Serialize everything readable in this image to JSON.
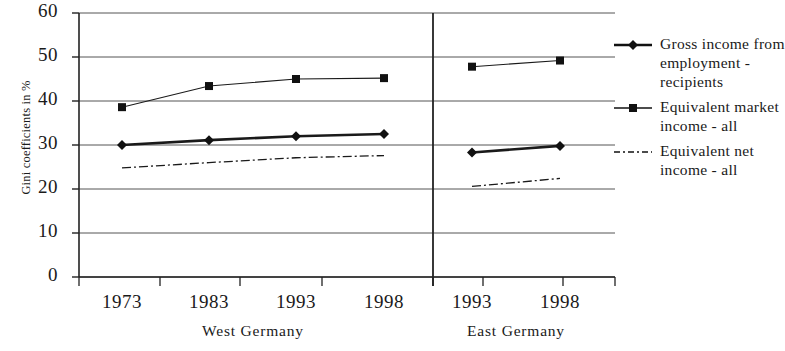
{
  "chart_data": {
    "type": "line",
    "title": "",
    "xlabel": "",
    "ylabel": "Gini coefficients in %",
    "ylim": [
      0,
      60
    ],
    "ytick_step": 10,
    "yticks": [
      "60",
      "50",
      "40",
      "30",
      "20",
      "10",
      "0"
    ],
    "grid": true,
    "legend_position": "right",
    "group_divider": true,
    "groups": [
      {
        "name": "West Germany",
        "categories": [
          "1973",
          "1983",
          "1993",
          "1998"
        ]
      },
      {
        "name": "East Germany",
        "categories": [
          "1993",
          "1998"
        ]
      }
    ],
    "categories": [
      "1973",
      "1983",
      "1993",
      "1998",
      "1993",
      "1998"
    ],
    "series": [
      {
        "name": "Gross income from employment - recipients",
        "marker": "diamond",
        "style": "solid",
        "color": "#1a1a1a",
        "west_values": [
          30.0,
          31.1,
          32.0,
          32.5
        ],
        "east_values": [
          28.3,
          29.8
        ]
      },
      {
        "name": "Equivalent market income - all",
        "marker": "square",
        "style": "solid-thin",
        "color": "#1a1a1a",
        "west_values": [
          38.6,
          43.4,
          45.0,
          45.2
        ],
        "east_values": [
          47.8,
          49.2
        ]
      },
      {
        "name": "Equivalent net income - all",
        "marker": "none",
        "style": "dash-dot",
        "color": "#1a1a1a",
        "west_values": [
          24.8,
          26.0,
          27.1,
          27.6
        ],
        "east_values": [
          20.6,
          22.4
        ]
      }
    ]
  },
  "legend": {
    "entries": [
      {
        "label": "Gross income from employment - recipients",
        "icon": "line-diamond-marker"
      },
      {
        "label": "Equivalent market income - all",
        "icon": "line-square-marker"
      },
      {
        "label": "Equivalent net income - all",
        "icon": "line-dash-dot"
      }
    ]
  }
}
